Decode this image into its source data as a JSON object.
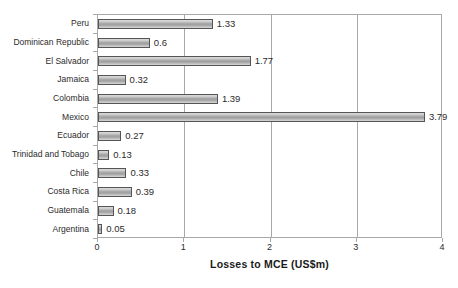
{
  "chart_data": {
    "type": "bar",
    "orientation": "horizontal",
    "title": "",
    "xlabel": "Losses to MCE (US$m)",
    "ylabel": "",
    "xlim": [
      0,
      4
    ],
    "xticks": [
      "0",
      "1",
      "2",
      "3",
      "4"
    ],
    "grid": true,
    "legend": false,
    "categories": [
      "Peru",
      "Dominican Republic",
      "El Salvador",
      "Jamaica",
      "Colombia",
      "Mexico",
      "Ecuador",
      "Trinidad and Tobago",
      "Chile",
      "Costa Rica",
      "Guatemala",
      "Argentina"
    ],
    "values": [
      1.33,
      0.6,
      1.77,
      0.32,
      1.39,
      3.79,
      0.27,
      0.13,
      0.33,
      0.39,
      0.18,
      0.05
    ],
    "value_labels": [
      "1.33",
      "0.6",
      "1.77",
      "0.32",
      "1.39",
      "3.79",
      "0.27",
      "0.13",
      "0.33",
      "0.39",
      "0.18",
      "0.05"
    ],
    "colors": {
      "bar_fill": "#b0b0b0",
      "bar_border": "#555555",
      "axis": "#a8a8a8",
      "text": "#2b2b2b",
      "background": "#ffffff"
    }
  }
}
